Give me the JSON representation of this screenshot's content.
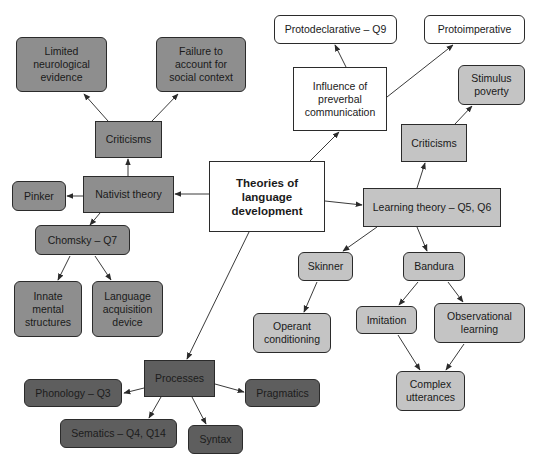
{
  "diagram": {
    "title": "Theories of language development",
    "colors": {
      "white_node": "#ffffff",
      "nativist_nodes": "#8e8e8e",
      "learning_nodes": "#c4c4c4",
      "process_nodes": "#5e5e5e",
      "border": "#2b2b2b",
      "edge": "#3a3a3a"
    },
    "nodes": {
      "root": {
        "label": "Theories of\nlanguage\ndevelopment"
      },
      "influence": {
        "label": "Influence of\npreverbal\ncommunication"
      },
      "protodeclarative": {
        "label": "Protodeclarative – Q9"
      },
      "protoimperative": {
        "label": "Protoimperative"
      },
      "nativist": {
        "label": "Nativist theory"
      },
      "nativist_criticisms": {
        "label": "Criticisms"
      },
      "limited_evidence": {
        "label": "Limited\nneurological\nevidence"
      },
      "failure_social": {
        "label": "Failure to\naccount for\nsocial context"
      },
      "pinker": {
        "label": "Pinker"
      },
      "chomsky": {
        "label": "Chomsky – Q7"
      },
      "innate": {
        "label": "Innate\nmental\nstructures"
      },
      "lad": {
        "label": "Language\nacquisition\ndevice"
      },
      "learning": {
        "label": "Learning theory – Q5, Q6"
      },
      "learning_criticisms": {
        "label": "Criticisms"
      },
      "stimulus_poverty": {
        "label": "Stimulus\npoverty"
      },
      "skinner": {
        "label": "Skinner"
      },
      "operant": {
        "label": "Operant\nconditioning"
      },
      "bandura": {
        "label": "Bandura"
      },
      "imitation": {
        "label": "Imitation"
      },
      "observational": {
        "label": "Observational\nlearning"
      },
      "complex": {
        "label": "Complex\nutterances"
      },
      "processes": {
        "label": "Processes"
      },
      "phonology": {
        "label": "Phonology – Q3"
      },
      "semantics": {
        "label": "Sematics – Q4, Q14"
      },
      "syntax": {
        "label": "Syntax"
      },
      "pragmatics": {
        "label": "Pragmatics"
      }
    },
    "edges": [
      {
        "from": "root",
        "to": "influence"
      },
      {
        "from": "influence",
        "to": "protodeclarative"
      },
      {
        "from": "influence",
        "to": "protoimperative"
      },
      {
        "from": "root",
        "to": "nativist"
      },
      {
        "from": "nativist",
        "to": "nativist_criticisms"
      },
      {
        "from": "nativist_criticisms",
        "to": "limited_evidence"
      },
      {
        "from": "nativist_criticisms",
        "to": "failure_social"
      },
      {
        "from": "nativist",
        "to": "pinker"
      },
      {
        "from": "nativist",
        "to": "chomsky"
      },
      {
        "from": "chomsky",
        "to": "innate"
      },
      {
        "from": "chomsky",
        "to": "lad"
      },
      {
        "from": "root",
        "to": "learning"
      },
      {
        "from": "learning",
        "to": "learning_criticisms"
      },
      {
        "from": "learning_criticisms",
        "to": "stimulus_poverty"
      },
      {
        "from": "learning",
        "to": "skinner"
      },
      {
        "from": "skinner",
        "to": "operant"
      },
      {
        "from": "learning",
        "to": "bandura"
      },
      {
        "from": "bandura",
        "to": "imitation"
      },
      {
        "from": "bandura",
        "to": "observational"
      },
      {
        "from": "imitation",
        "to": "complex"
      },
      {
        "from": "observational",
        "to": "complex"
      },
      {
        "from": "root",
        "to": "processes"
      },
      {
        "from": "processes",
        "to": "phonology"
      },
      {
        "from": "processes",
        "to": "semantics"
      },
      {
        "from": "processes",
        "to": "syntax"
      },
      {
        "from": "processes",
        "to": "pragmatics"
      }
    ]
  }
}
